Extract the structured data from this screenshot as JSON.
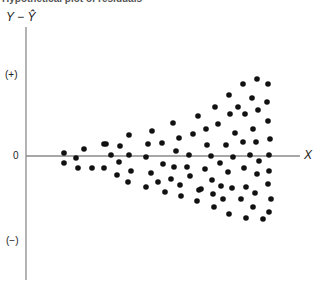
{
  "chart_data": {
    "type": "scatter",
    "title": "Hypothetical plot of residuals",
    "xlabel": "X",
    "ylabel": "Y − Ŷ",
    "y_tick_labels": [
      "(+)",
      "0",
      "(−)"
    ],
    "grid": false,
    "legend": null,
    "axes_px": {
      "y_axis_x": 26,
      "y_axis_top": 27,
      "y_axis_bottom": 280,
      "zero_y": 156,
      "x_axis_left": 26,
      "x_axis_right": 300
    },
    "points_px": [
      [
        64,
        153
      ],
      [
        64,
        163
      ],
      [
        76,
        158
      ],
      [
        78,
        168
      ],
      [
        84,
        149
      ],
      [
        92,
        168
      ],
      [
        104,
        144
      ],
      [
        104,
        168
      ],
      [
        106,
        144
      ],
      [
        111,
        155
      ],
      [
        117,
        175
      ],
      [
        119,
        162
      ],
      [
        120,
        146
      ],
      [
        128,
        182
      ],
      [
        129,
        135
      ],
      [
        129,
        155
      ],
      [
        131,
        171
      ],
      [
        146,
        157
      ],
      [
        146,
        187
      ],
      [
        148,
        144
      ],
      [
        151,
        173
      ],
      [
        152,
        131
      ],
      [
        158,
        182
      ],
      [
        162,
        143
      ],
      [
        163,
        164
      ],
      [
        165,
        192
      ],
      [
        173,
        123
      ],
      [
        174,
        167
      ],
      [
        171,
        179
      ],
      [
        176,
        151
      ],
      [
        179,
        138
      ],
      [
        180,
        185
      ],
      [
        181,
        196
      ],
      [
        187,
        167
      ],
      [
        189,
        155
      ],
      [
        190,
        176
      ],
      [
        193,
        134
      ],
      [
        197,
        201
      ],
      [
        198,
        116
      ],
      [
        199,
        190
      ],
      [
        205,
        169
      ],
      [
        206,
        129
      ],
      [
        207,
        145
      ],
      [
        201,
        189
      ],
      [
        211,
        156
      ],
      [
        212,
        180
      ],
      [
        213,
        194
      ],
      [
        214,
        207
      ],
      [
        215,
        107
      ],
      [
        218,
        124
      ],
      [
        220,
        163
      ],
      [
        221,
        186
      ],
      [
        223,
        199
      ],
      [
        226,
        145
      ],
      [
        228,
        172
      ],
      [
        229,
        95
      ],
      [
        229,
        214
      ],
      [
        230,
        114
      ],
      [
        232,
        188
      ],
      [
        233,
        157
      ],
      [
        235,
        133
      ],
      [
        238,
        107
      ],
      [
        241,
        199
      ],
      [
        243,
        84
      ],
      [
        243,
        142
      ],
      [
        244,
        168
      ],
      [
        245,
        114
      ],
      [
        246,
        187
      ],
      [
        246,
        218
      ],
      [
        250,
        155
      ],
      [
        252,
        98
      ],
      [
        253,
        129
      ],
      [
        253,
        207
      ],
      [
        255,
        193
      ],
      [
        256,
        142
      ],
      [
        257,
        79
      ],
      [
        257,
        174
      ],
      [
        258,
        110
      ],
      [
        259,
        161
      ],
      [
        263,
        219
      ],
      [
        267,
        102
      ],
      [
        268,
        84
      ],
      [
        268,
        121
      ],
      [
        268,
        184
      ],
      [
        269,
        155
      ],
      [
        269,
        171
      ],
      [
        269,
        212
      ],
      [
        270,
        139
      ],
      [
        271,
        199
      ]
    ]
  },
  "colors": {
    "axis": "#8a8a8a",
    "point": "#111111",
    "text": "#222222"
  }
}
